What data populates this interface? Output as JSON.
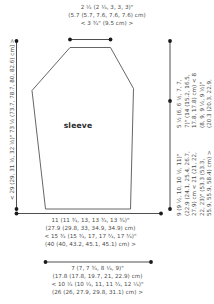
{
  "diagram": {
    "type": "knitting-schematic",
    "piece_label": "sleeve",
    "shape": "tapered-sleeve-outline",
    "line_color": "#555555",
    "text_color": "#4a4a4a",
    "background": "#ffffff"
  },
  "measurements": {
    "top": {
      "name": "sleeve-cap-top-width",
      "lines": [
        "2 ¹⁄₄ (2 ¹⁄₄, 3, 3, 3)\"",
        "(5.7 (5.7, 7.6, 7.6, 7.6) cm)",
        "< 3 ³⁄₄\" (9.5 cm) >"
      ]
    },
    "left": {
      "name": "sleeve-total-length",
      "lines": [
        "< 29 (29, 31 ¹⁄₂, 32 ¹⁄₂)\" 73 ¹⁄₂ (73.7, 78.7, 80, 82.6) cm] >"
      ]
    },
    "right_upper": {
      "name": "sleeve-cap-height",
      "lines": [
        "5 ¹⁄₂ (6, 6 ¹⁄₂, 7, 7,",
        "7)\" (14 (15.2, 16.5,",
        "17.8, 17.8) cm) < 8",
        "(8, 9, 9 ¹⁄₂, 9 ¹⁄₂)\"",
        "(20.3 (20.3, 22.9,",
        "24.1, 24.1) cm) >"
      ]
    },
    "right_lower": {
      "name": "sleeve-underarm-length",
      "lines": [
        "9 (9 ¹⁄₂, 10, 10 ¹⁄₂, 11)\"",
        "(22.9 (24.1, 25.4, 26.7,",
        "27.9) cm < 21 (21, 22,",
        "22, 23)\" (53.3 (53.3,",
        "55.9, 55.9, 58.4) cm) >"
      ]
    },
    "bottom_upper": {
      "name": "sleeve-upper-arm-width",
      "lines": [
        "11 (11 ³⁄₄, 13, 13 ³⁄₄, 13 ³⁄₄)\"",
        "(27.9 (29.8, 33, 34.9, 34.9) cm)",
        "< 15 ³⁄₄ (15 ³⁄₄, 17, 17 ³⁄₄, 17 ³⁄₄)\"",
        "(40 (40, 43.2, 45.1, 45.1) cm) >"
      ]
    },
    "bottom_lower": {
      "name": "sleeve-cuff-width",
      "lines": [
        "7 (7, 7 ³⁄₄, 8 ¹⁄₄, 9)\"",
        "(17.8 (17.8, 19.7, 21, 22.9) cm)",
        "< 10 ¹⁄₄ (10 ¹⁄₄, 11, 11 ³⁄₄, 12 ¹⁄₄)\"",
        "(26 (26, 27.9, 29.8, 31.1) cm) >"
      ]
    }
  }
}
